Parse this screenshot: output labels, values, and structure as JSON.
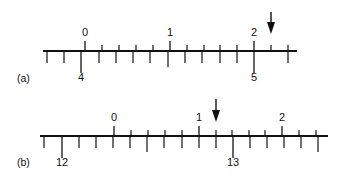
{
  "figure": {
    "width": 343,
    "height": 180,
    "ink_color": "#111111",
    "background": "#ffffff",
    "scales": [
      {
        "id": "a",
        "label": "(a)",
        "label_pos": [
          17,
          82
        ],
        "line": {
          "y": 51,
          "x_start": 43,
          "x_end": 297
        },
        "upper": {
          "major_ticks": [
            {
              "x": 85,
              "value": "0"
            },
            {
              "x": 170,
              "value": "1"
            },
            {
              "x": 254,
              "value": "2"
            }
          ],
          "minor_ticks_x": [
            102,
            119,
            136,
            153,
            187,
            204,
            220,
            237,
            271,
            288
          ],
          "major_len": 10,
          "minor_len": 6,
          "label_offset": 15
        },
        "lower": {
          "major_ticks": [
            {
              "x": 81,
              "value": "4"
            },
            {
              "x": 254,
              "value": "5"
            }
          ],
          "half_ticks_x": [
            168
          ],
          "minor_ticks_x": [
            47,
            64,
            99,
            116,
            133,
            150,
            185,
            202,
            220,
            237,
            288
          ],
          "major_len": 22,
          "half_len": 16,
          "minor_len": 12,
          "label_offset": 30
        },
        "arrow": {
          "x": 271,
          "y_top": 12,
          "y_tip": 34
        }
      },
      {
        "id": "b",
        "label": "(b)",
        "label_pos": [
          17,
          166
        ],
        "line": {
          "y": 136,
          "x_start": 40,
          "x_end": 328
        },
        "upper": {
          "major_ticks": [
            {
              "x": 114,
              "value": "0"
            },
            {
              "x": 199,
              "value": "1"
            },
            {
              "x": 282,
              "value": "2"
            }
          ],
          "minor_ticks_x": [
            131,
            148,
            165,
            182,
            216,
            232,
            249,
            265,
            299,
            316
          ],
          "major_len": 10,
          "minor_len": 6,
          "label_offset": 15
        },
        "lower": {
          "major_ticks": [
            {
              "x": 62,
              "value": "12"
            },
            {
              "x": 233,
              "value": "13"
            }
          ],
          "half_ticks_x": [
            147,
            318
          ],
          "minor_ticks_x": [
            44,
            79,
            96,
            113,
            130,
            164,
            182,
            199,
            216,
            250,
            267,
            284,
            301
          ],
          "major_len": 22,
          "half_len": 16,
          "minor_len": 12,
          "label_offset": 30
        },
        "arrow": {
          "x": 216,
          "y_top": 99,
          "y_tip": 122
        }
      }
    ]
  }
}
